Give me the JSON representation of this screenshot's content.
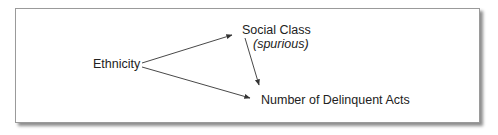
{
  "diagram": {
    "nodes": {
      "ethnicity": {
        "label": "Ethnicity"
      },
      "social_class": {
        "label": "Social Class",
        "annotation": "(spurious)"
      },
      "delinquent_acts": {
        "label": "Number of Delinquent Acts"
      }
    },
    "edges": [
      {
        "from": "Ethnicity",
        "to": "Social Class"
      },
      {
        "from": "Ethnicity",
        "to": "Number of Delinquent Acts"
      },
      {
        "from": "Social Class",
        "to": "Number of Delinquent Acts"
      }
    ],
    "colors": {
      "line": "#333333",
      "border": "#9a9a9a",
      "text": "#222222"
    }
  }
}
